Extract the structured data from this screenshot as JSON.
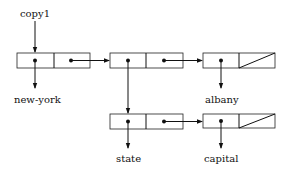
{
  "diagram": {
    "type": "linked-list cons-cell diagram",
    "variable": {
      "label": "copy1"
    },
    "cells": [
      {
        "id": "cell1",
        "car": "new-york",
        "cdr": "cell2"
      },
      {
        "id": "cell2",
        "car": "cell4",
        "cdr": "cell3"
      },
      {
        "id": "cell3",
        "car": "albany",
        "cdr": "nil"
      },
      {
        "id": "cell4",
        "car": "state",
        "cdr": "cell5"
      },
      {
        "id": "cell5",
        "car": "capital",
        "cdr": "nil"
      }
    ],
    "atoms": {
      "new_york": "new-york",
      "albany": "albany",
      "state": "state",
      "capital": "capital"
    }
  }
}
